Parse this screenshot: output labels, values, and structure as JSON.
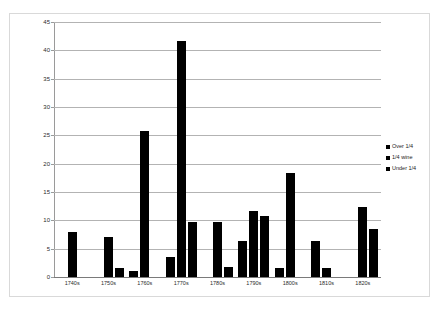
{
  "chart_data": {
    "type": "bar",
    "title": "",
    "xlabel": "",
    "ylabel": "",
    "ylim": [
      0,
      45
    ],
    "ytick_step": 5,
    "grid": true,
    "legend_position": "right",
    "categories": [
      "1740s",
      "1750s",
      "1760s",
      "1770s",
      "1780s",
      "1790s",
      "1800s",
      "1810s",
      "1820s"
    ],
    "yticks": [
      "0",
      "5",
      "10",
      "15",
      "20",
      "25",
      "30",
      "35",
      "40",
      "45"
    ],
    "series": [
      {
        "name": "Over 1/4",
        "values": [
          0,
          0,
          1.0,
          3.5,
          0,
          6.4,
          1.6,
          6.4,
          0
        ]
      },
      {
        "name": "1/4 wine",
        "values": [
          8.0,
          7.0,
          25.8,
          41.7,
          9.7,
          11.6,
          18.4,
          1.6,
          12.3
        ]
      },
      {
        "name": "Under 1/4",
        "values": [
          0,
          1.6,
          0,
          9.7,
          1.7,
          10.8,
          0,
          0,
          8.4
        ]
      }
    ],
    "bar_color": "#000000"
  },
  "legend": {
    "items": [
      {
        "label": "Over 1/4"
      },
      {
        "label": "1/4 wine"
      },
      {
        "label": "Under 1/4"
      }
    ]
  }
}
